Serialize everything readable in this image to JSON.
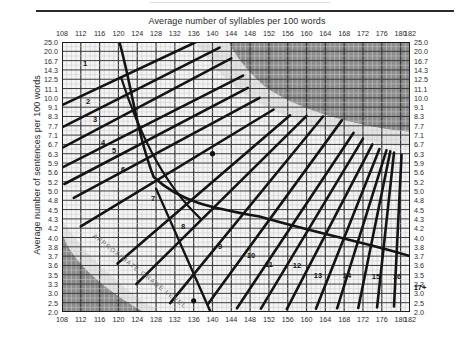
{
  "titles": {
    "x_title": "Average number of syllables per 100 words",
    "y_title": "Average number of sentences per 100 words"
  },
  "annotations": {
    "approx_grade_level": "APPROXIMATE GRADE LEVEL"
  },
  "chart_data": {
    "type": "line",
    "title": "",
    "xlabel": "Average number of syllables per 100 words",
    "ylabel": "Average number of sentences per 100 words",
    "xlim": [
      108,
      182
    ],
    "ylim": [
      2.0,
      25.0
    ],
    "grid": true,
    "legend": "none",
    "x_ticks": [
      108,
      112,
      116,
      120,
      124,
      128,
      132,
      136,
      140,
      144,
      148,
      152,
      156,
      160,
      164,
      168,
      172,
      176,
      180,
      182
    ],
    "y_ticks": [
      25.0,
      20.0,
      16.7,
      14.3,
      12.5,
      11.1,
      10.0,
      9.1,
      8.3,
      7.7,
      7.1,
      6.7,
      6.3,
      5.9,
      5.6,
      5.2,
      5.0,
      4.8,
      4.5,
      4.3,
      4.2,
      4.0,
      3.8,
      3.7,
      3.6,
      3.5,
      3.3,
      3.0,
      2.5,
      2.0
    ],
    "y_tick_labels": [
      "25.0",
      "20.0",
      "16.7",
      "14.3",
      "12.5",
      "11.1",
      "10.0",
      "9.1",
      "8.3",
      "7.7",
      "7.1",
      "6.7",
      "6.3",
      "5.9",
      "5.6",
      "5.2",
      "5.0",
      "4.8",
      "4.5",
      "4.3",
      "4.2",
      "4.0",
      "3.8",
      "3.7",
      "3.6",
      "3.5",
      "3.3",
      "3.0",
      "2.5",
      "2.0"
    ],
    "grade_labels": [
      "1",
      "2",
      "3",
      "4",
      "5",
      "6",
      "7",
      "8",
      "9",
      "10",
      "11",
      "12",
      "13",
      "14",
      "15",
      "16",
      "17+"
    ],
    "grade_label_positions": [
      {
        "label": "1",
        "x": 85,
        "y": 63
      },
      {
        "label": "2",
        "x": 88,
        "y": 101
      },
      {
        "label": "3",
        "x": 95,
        "y": 119
      },
      {
        "label": "4",
        "x": 103,
        "y": 142
      },
      {
        "label": "5",
        "x": 114,
        "y": 150
      },
      {
        "label": "6",
        "x": 123,
        "y": 169
      },
      {
        "label": "7",
        "x": 153,
        "y": 198
      },
      {
        "label": "8",
        "x": 183,
        "y": 226
      },
      {
        "label": "9",
        "x": 220,
        "y": 246
      },
      {
        "label": "10",
        "x": 251,
        "y": 255
      },
      {
        "label": "11",
        "x": 269,
        "y": 264
      },
      {
        "label": "12",
        "x": 297,
        "y": 265
      },
      {
        "label": "13",
        "x": 318,
        "y": 275
      },
      {
        "label": "14",
        "x": 347,
        "y": 275
      },
      {
        "label": "15",
        "x": 376,
        "y": 276
      },
      {
        "label": "16",
        "x": 397,
        "y": 276
      },
      {
        "label": "17+",
        "x": 420,
        "y": 287
      }
    ],
    "shaded_regions": [
      {
        "name": "invalid-upper-right",
        "color": "#8c8c8c"
      },
      {
        "name": "invalid-lower-left",
        "color": "#8c8c8c"
      },
      {
        "name": "transition-band",
        "color": "#e3e3e3"
      }
    ],
    "plotted_points": [
      {
        "x": 140,
        "y": 6.3
      },
      {
        "x": 136,
        "y": 2.6
      }
    ],
    "colors": {
      "plot_background": "#f4f4f4",
      "gridline_minor": "#c9c9c9",
      "gridline_major": "#3a3a3a",
      "grade_line": "#141414",
      "shade_dark": "#8c8c8c",
      "shade_light": "#e3e3e3",
      "axis_text": "#2b2b2b"
    }
  }
}
